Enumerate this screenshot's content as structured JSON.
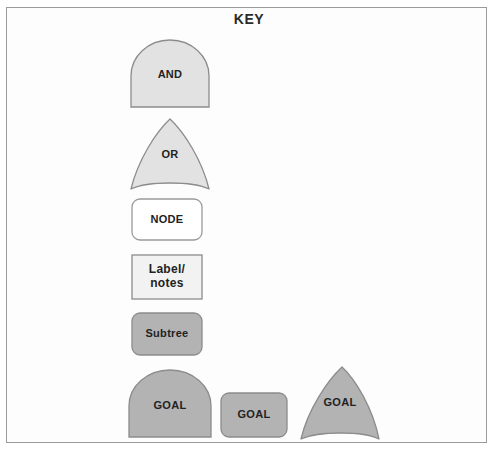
{
  "diagram": {
    "title": "KEY",
    "frame_border_color": "#9a9a9a",
    "background_color": "#ffffff"
  },
  "palette": {
    "light_fill": "#e2e2e2",
    "light_stroke": "#8c8c8c",
    "white_fill": "#ffffff",
    "white_stroke": "#9a9a9a",
    "label_fill": "#f2f2f2",
    "label_stroke": "#8c8c8c",
    "dark_fill": "#b3b3b3",
    "dark_stroke": "#8c8c8c",
    "text_color": "#222222"
  },
  "legend_items": [
    {
      "id": "and",
      "label": "AND",
      "shape": "dome",
      "fill": "#e2e2e2",
      "stroke": "#8c8c8c"
    },
    {
      "id": "or",
      "label": "OR",
      "shape": "pointed-arch",
      "fill": "#e2e2e2",
      "stroke": "#8c8c8c"
    },
    {
      "id": "node",
      "label": "NODE",
      "shape": "rounded-rect",
      "fill": "#ffffff",
      "stroke": "#9a9a9a"
    },
    {
      "id": "label-notes",
      "label_line1": "Label/",
      "label_line2": "notes",
      "shape": "rect",
      "fill": "#f2f2f2",
      "stroke": "#8c8c8c"
    },
    {
      "id": "subtree",
      "label": "Subtree",
      "shape": "rounded-rect",
      "fill": "#b3b3b3",
      "stroke": "#8c8c8c"
    },
    {
      "id": "goal-dome",
      "label": "GOAL",
      "shape": "dome",
      "fill": "#b3b3b3",
      "stroke": "#8c8c8c"
    },
    {
      "id": "goal-rect",
      "label": "GOAL",
      "shape": "rounded-rect",
      "fill": "#b3b3b3",
      "stroke": "#8c8c8c"
    },
    {
      "id": "goal-arch",
      "label": "GOAL",
      "shape": "pointed-arch",
      "fill": "#b3b3b3",
      "stroke": "#8c8c8c"
    }
  ]
}
